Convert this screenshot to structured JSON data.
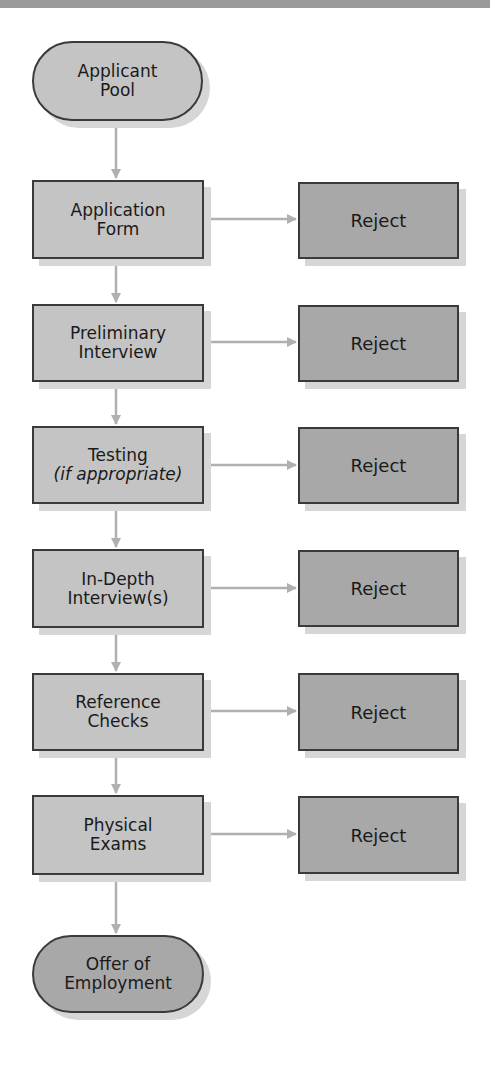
{
  "diagram": {
    "type": "flowchart",
    "colors": {
      "step_fill": "#c4c4c4",
      "reject_fill": "#a8a8a8",
      "border": "#3a3a3a",
      "arrow": "#b0b0b0",
      "shadow": "#d6d6d6"
    },
    "start": {
      "line1": "Applicant",
      "line2": "Pool"
    },
    "steps": [
      {
        "line1": "Application",
        "line2": "Form",
        "reject": "Reject"
      },
      {
        "line1": "Preliminary",
        "line2": "Interview",
        "reject": "Reject"
      },
      {
        "line1": "Testing",
        "line2": "(if appropriate)",
        "reject": "Reject"
      },
      {
        "line1": "In-Depth",
        "line2": "Interview(s)",
        "reject": "Reject"
      },
      {
        "line1": "Reference",
        "line2": "Checks",
        "reject": "Reject"
      },
      {
        "line1": "Physical",
        "line2": "Exams",
        "reject": "Reject"
      }
    ],
    "end": {
      "line1": "Offer of",
      "line2": "Employment"
    }
  }
}
